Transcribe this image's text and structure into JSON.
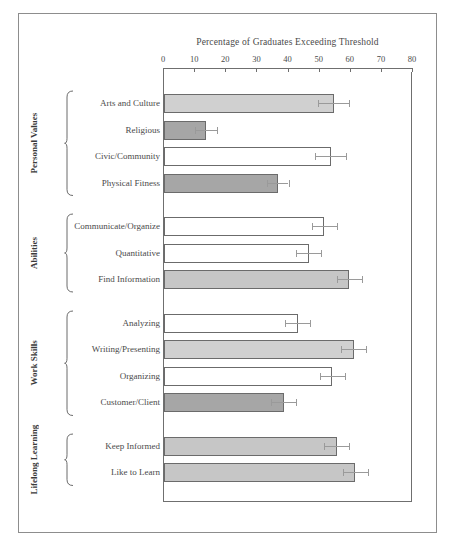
{
  "figure": {
    "frame_color": "#8d8d8d",
    "background": "#ffffff"
  },
  "chart_data": {
    "type": "bar",
    "orientation": "horizontal",
    "title": "Percentage of Graduates Exceeding Threshold",
    "xlabel": "",
    "ylabel": "",
    "xlim": [
      0,
      80
    ],
    "xticks": [
      0,
      10,
      20,
      30,
      40,
      50,
      60,
      70,
      80
    ],
    "xtick_labels": [
      "0",
      "10",
      "20",
      "30",
      "40",
      "50",
      "60",
      "70",
      "80"
    ],
    "grid": false,
    "legend": "none",
    "error_bars": "symmetric",
    "groups": [
      {
        "name": "Personal Values",
        "categories": [
          "Arts and Culture",
          "Religious",
          "Civic/Community",
          "Physical Fitness"
        ],
        "values": [
          54.5,
          13.5,
          53.5,
          36.5
        ],
        "errors": [
          5.0,
          3.5,
          5.0,
          3.5
        ],
        "fills": [
          "#d0d0d0",
          "#a6a6a6",
          "#ffffff",
          "#a6a6a6"
        ]
      },
      {
        "name": "Abilities",
        "categories": [
          "Communicate/Organize",
          "Quantitative",
          "Find Information"
        ],
        "values": [
          51.5,
          46.5,
          59.5
        ],
        "errors": [
          4.0,
          4.0,
          4.0
        ],
        "fills": [
          "#ffffff",
          "#ffffff",
          "#c6c6c6"
        ]
      },
      {
        "name": "Work Skills",
        "categories": [
          "Analyzing",
          "Writing/Presenting",
          "Organizing",
          "Customer/Client"
        ],
        "values": [
          43.0,
          61.0,
          54.0,
          38.5
        ],
        "errors": [
          4.0,
          4.0,
          4.0,
          4.0
        ],
        "fills": [
          "#ffffff",
          "#d0d0d0",
          "#ffffff",
          "#a6a6a6"
        ]
      },
      {
        "name": "Lifelong Learning",
        "categories": [
          "Keep Informed",
          "Like to Learn"
        ],
        "values": [
          55.5,
          61.5
        ],
        "errors": [
          4.0,
          4.0
        ],
        "fills": [
          "#c6c6c6",
          "#c6c6c6"
        ]
      }
    ]
  }
}
